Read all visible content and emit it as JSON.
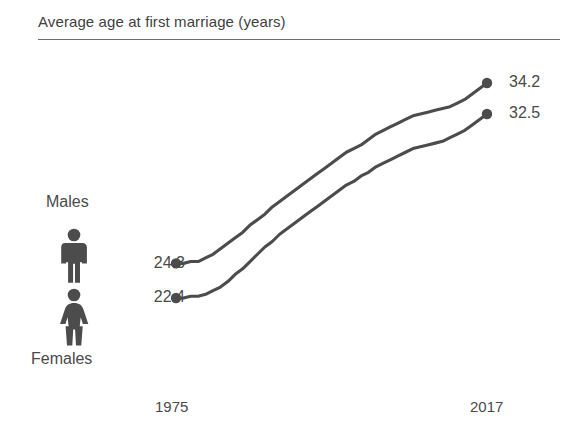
{
  "chart": {
    "title": "Average age at first marriage (years)",
    "accent_color": "#4c4c4c",
    "text_color": "#4a4a4a"
  },
  "labels": {
    "males": "Males",
    "females": "Females",
    "male_icon": "male-pictogram-icon",
    "female_icon": "female-pictogram-icon"
  },
  "axis": {
    "start_year": "1975",
    "end_year": "2017"
  },
  "values": {
    "male_start": "24.3",
    "male_end": "34.2",
    "female_start": "22.4",
    "female_end": "32.5"
  },
  "chart_data": {
    "type": "line",
    "title": "Average age at first marriage (years)",
    "xlabel": "",
    "ylabel": "Average age at first marriage (years)",
    "grid": false,
    "legend_position": "left-inline-pictograms",
    "xlim": [
      1975,
      2017
    ],
    "ylim": [
      21.5,
      35.0
    ],
    "x": [
      1975,
      1976,
      1977,
      1978,
      1979,
      1980,
      1981,
      1982,
      1983,
      1984,
      1985,
      1986,
      1987,
      1988,
      1989,
      1990,
      1991,
      1992,
      1993,
      1994,
      1995,
      1996,
      1997,
      1998,
      1999,
      2000,
      2001,
      2002,
      2003,
      2004,
      2005,
      2006,
      2007,
      2008,
      2009,
      2010,
      2011,
      2012,
      2013,
      2014,
      2015,
      2016,
      2017
    ],
    "series": [
      {
        "name": "Males",
        "endpoint_labels": [
          "24.3",
          "34.2"
        ],
        "values": [
          24.3,
          24.3,
          24.4,
          24.4,
          24.6,
          24.8,
          25.1,
          25.4,
          25.7,
          26.0,
          26.4,
          26.7,
          27.0,
          27.4,
          27.7,
          28.0,
          28.3,
          28.6,
          28.9,
          29.2,
          29.5,
          29.8,
          30.1,
          30.4,
          30.6,
          30.8,
          31.1,
          31.4,
          31.6,
          31.8,
          32.0,
          32.2,
          32.4,
          32.5,
          32.6,
          32.7,
          32.8,
          32.9,
          33.1,
          33.3,
          33.6,
          33.9,
          34.2
        ]
      },
      {
        "name": "Females",
        "endpoint_labels": [
          "22.4",
          "32.5"
        ],
        "values": [
          22.4,
          22.4,
          22.5,
          22.5,
          22.6,
          22.8,
          23.0,
          23.3,
          23.7,
          24.0,
          24.4,
          24.8,
          25.2,
          25.5,
          25.9,
          26.2,
          26.5,
          26.8,
          27.1,
          27.4,
          27.7,
          28.0,
          28.3,
          28.6,
          28.8,
          29.1,
          29.3,
          29.6,
          29.8,
          30.0,
          30.2,
          30.4,
          30.6,
          30.7,
          30.8,
          30.9,
          31.0,
          31.2,
          31.4,
          31.6,
          31.9,
          32.2,
          32.5
        ]
      }
    ]
  }
}
